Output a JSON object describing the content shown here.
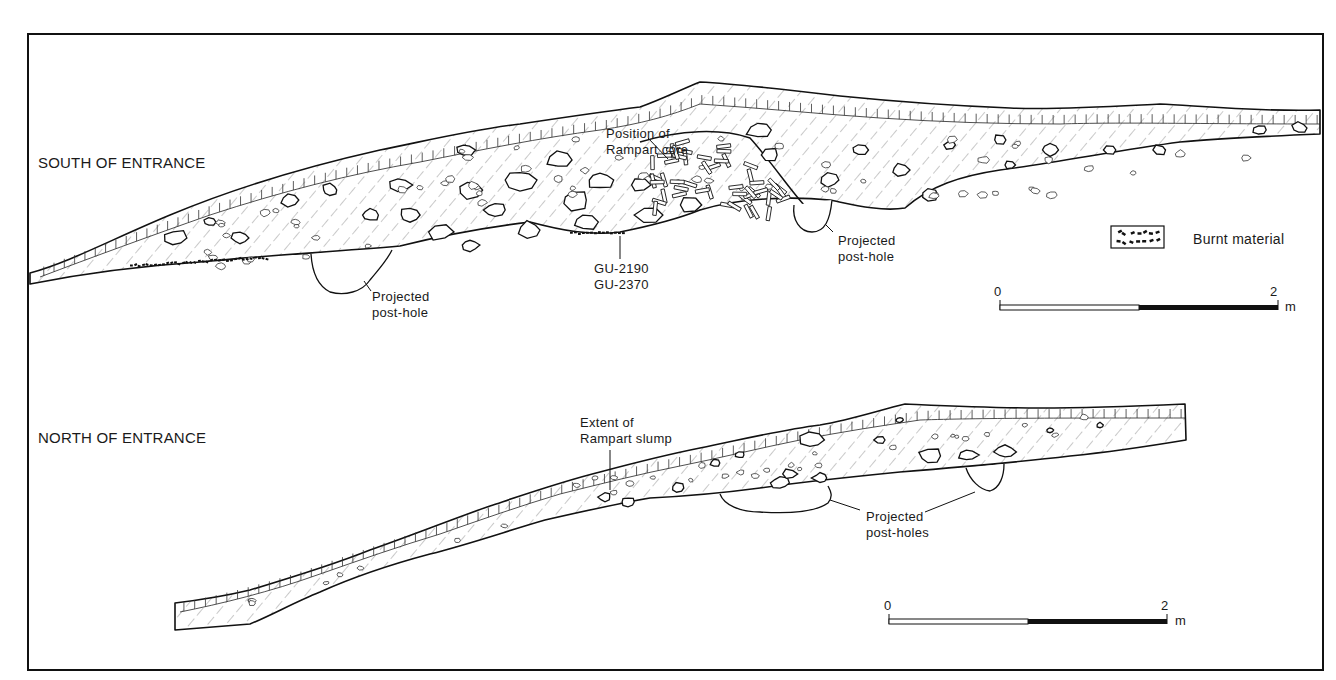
{
  "figure": {
    "sections": [
      {
        "id": "south",
        "title": "SOUTH OF ENTRANCE",
        "annotations": [
          {
            "id": "rampart-core",
            "lines": [
              "Position of",
              "Rampart core"
            ]
          },
          {
            "id": "sample-codes",
            "lines": [
              "GU-2190",
              "GU-2370"
            ]
          },
          {
            "id": "posthole-left",
            "lines": [
              "Projected",
              "post-hole"
            ]
          },
          {
            "id": "posthole-right",
            "lines": [
              "Projected",
              "post-hole"
            ]
          }
        ],
        "scale_bar": {
          "start_label": "0",
          "end_label": "2",
          "unit": "m",
          "length_m": 2
        }
      },
      {
        "id": "north",
        "title": "NORTH OF ENTRANCE",
        "annotations": [
          {
            "id": "rampart-slump",
            "lines": [
              "Extent of",
              "Rampart slump"
            ]
          },
          {
            "id": "postholes",
            "lines": [
              "Projected",
              "post-holes"
            ]
          }
        ],
        "scale_bar": {
          "start_label": "0",
          "end_label": "2",
          "unit": "m",
          "length_m": 2
        }
      }
    ],
    "legend": {
      "items": [
        {
          "symbol": "burnt-material-hatch",
          "label": "Burnt material"
        }
      ]
    },
    "colors": {
      "ink": "#111111",
      "paper": "#ffffff"
    }
  }
}
